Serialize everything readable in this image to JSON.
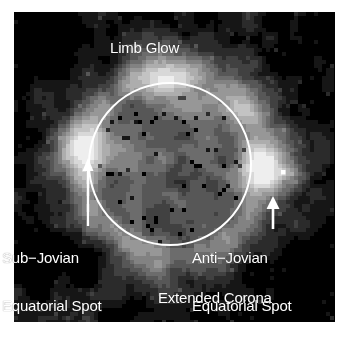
{
  "figure": {
    "kind": "astronomical-grayscale-image",
    "background_color": "#ffffff",
    "plate_color": "#000000",
    "annotation_color": "#ffffff"
  },
  "annotations": {
    "limb_glow": "Limb Glow",
    "sub_jovian_line1": "Sub−Jovian",
    "sub_jovian_line2": "Equatorial Spot",
    "anti_jovian_line1": "Anti−Jovian",
    "anti_jovian_line2": "Equatorial Spot",
    "extended_corona": "Extended Corona"
  },
  "overlay": {
    "disk_circle": {
      "cx": 156,
      "cy": 152,
      "r": 81,
      "stroke": "#ffffff",
      "stroke_width": 2
    },
    "arrow_left": {
      "x": 74,
      "y_tip": 148,
      "y_base": 214,
      "stroke": "#ffffff"
    },
    "arrow_right": {
      "x": 259,
      "y_tip": 186,
      "y_base": 216,
      "stroke": "#ffffff"
    },
    "bright_spot": {
      "x": 269,
      "y": 160,
      "size": 4,
      "color": "#ffffff"
    }
  },
  "image_field": {
    "note": "Blocky low-resolution intensity field rendered from a seeded noise model",
    "block_size": 4,
    "cols": 80,
    "rows": 78,
    "levels": 12,
    "disk": {
      "cx_blocks": 39,
      "cy_blocks": 38,
      "r_blocks": 21
    },
    "corona": {
      "r_blocks": 34
    },
    "hotspots": [
      {
        "cx_blocks": 17,
        "cy_blocks": 33,
        "r_blocks": 9,
        "gain": 0.85
      },
      {
        "cx_blocks": 64,
        "cy_blocks": 38,
        "r_blocks": 9,
        "gain": 0.82
      },
      {
        "cx_blocks": 38,
        "cy_blocks": 16,
        "r_blocks": 11,
        "gain": 0.45
      },
      {
        "cx_blocks": 56,
        "cy_blocks": 22,
        "r_blocks": 8,
        "gain": 0.4
      }
    ],
    "dark_corners": [
      {
        "cx_blocks": 6,
        "cy_blocks": 6
      },
      {
        "cx_blocks": 74,
        "cy_blocks": 5
      },
      {
        "cx_blocks": 8,
        "cy_blocks": 62
      },
      {
        "cx_blocks": 70,
        "cy_blocks": 70
      }
    ]
  }
}
